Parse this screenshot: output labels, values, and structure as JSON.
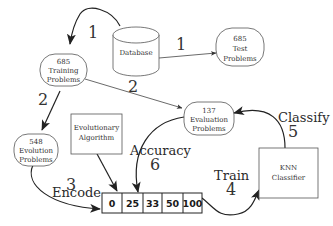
{
  "nodes": {
    "database": {
      "label": "Database"
    },
    "training": {
      "count": "685",
      "line1": "Training",
      "line2": "Problems"
    },
    "test": {
      "count": "685",
      "line1": "Test",
      "line2": "Problems"
    },
    "evolution": {
      "count": "548",
      "line1": "Evolution",
      "line2": "Problems"
    },
    "evaluation": {
      "count": "137",
      "line1": "Evaluation",
      "line2": "Problems"
    },
    "evolutionary_algorithm": {
      "line1": "Evolutionary",
      "line2": "Algorithm"
    },
    "knn": {
      "line1": "KNN",
      "line2": "Classifier"
    }
  },
  "encoding_array": [
    "0",
    "25",
    "33",
    "50",
    "100"
  ],
  "edges": {
    "db_to_training": {
      "step": "1"
    },
    "db_to_test": {
      "step": "1"
    },
    "training_to_evolution": {
      "step": "2"
    },
    "training_to_evaluation": {
      "step": "2"
    },
    "encode": {
      "step": "3",
      "label": "Encode"
    },
    "train": {
      "step": "4",
      "label": "Train"
    },
    "classify": {
      "step": "5",
      "label": "Classify"
    },
    "accuracy": {
      "step": "6",
      "label": "Accuracy"
    }
  },
  "colors": {
    "stroke": "#222222",
    "node_border": "#555555",
    "background": "#ffffff"
  }
}
